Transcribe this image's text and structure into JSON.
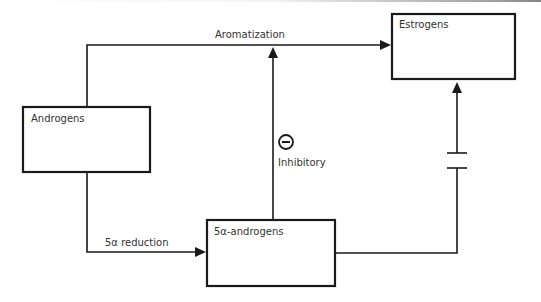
{
  "nodes": {
    "androgens": {
      "label": "Androgens"
    },
    "estrogens": {
      "label": "Estrogens"
    },
    "five_alpha_androgens": {
      "label": "5α-androgens"
    }
  },
  "edges": {
    "aromatization": {
      "label": "Aromatization",
      "from": "Androgens",
      "to": "Estrogens"
    },
    "reduction": {
      "label": "5α reduction",
      "from": "Androgens",
      "to": "5α-androgens"
    },
    "inhibitory": {
      "label": "Inhibitory",
      "symbol": "minus-circle",
      "from": "5α-androgens",
      "to": "Aromatization"
    },
    "blocked": {
      "label": "",
      "from": "5α-androgens",
      "to": "Estrogens",
      "style": "broken-line"
    }
  },
  "colors": {
    "stroke": "#1a1a1a",
    "text": "#333333",
    "background": "#ffffff"
  }
}
